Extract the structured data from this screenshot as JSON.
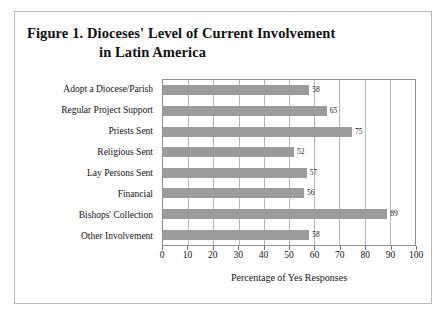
{
  "figure": {
    "title_line_1": "Figure 1.  Dioceses' Level of Current Involvement",
    "title_line_2": "in Latin America"
  },
  "chart_data": {
    "type": "bar",
    "orientation": "horizontal",
    "title": "Figure 1.  Dioceses' Level of Current Involvement in Latin America",
    "categories": [
      "Adopt a Diocese/Parish",
      "Regular Project Support",
      "Priests Sent",
      "Religious Sent",
      "Lay Persons Sent",
      "Financial",
      "Bishops' Collection",
      "Other Involvement"
    ],
    "values": [
      58,
      65,
      75,
      52,
      57,
      56,
      89,
      58
    ],
    "xlabel": "Percentage of Yes Responses",
    "ylabel": "",
    "xlim": [
      0,
      100
    ],
    "xticks": [
      0,
      10,
      20,
      30,
      40,
      50,
      60,
      70,
      80,
      90,
      100
    ],
    "grid": true,
    "grid_axis": "x",
    "legend": false,
    "bar_color": "#9b9b9b",
    "grid_color": "#b5b5b5",
    "axis_color": "#8f8f8f",
    "frame_color": "#b9b9b9",
    "background": "#ffffff"
  }
}
